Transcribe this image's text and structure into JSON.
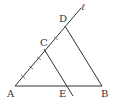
{
  "diagram": {
    "type": "geometry",
    "points": {
      "A": {
        "label": "A",
        "x": 15,
        "y": 86
      },
      "B": {
        "label": "B",
        "x": 102,
        "y": 86
      },
      "C": {
        "label": "C",
        "x": 44,
        "y": 50
      },
      "D": {
        "label": "D",
        "x": 65,
        "y": 26
      },
      "E": {
        "label": "E",
        "x": 67,
        "y": 86
      }
    },
    "line_label": "ℓ",
    "segments": [
      "AB",
      "AD (line ℓ)",
      "DB",
      "CE (extended)"
    ],
    "tick_marks": "equal segments marked along line ℓ from A through C to D",
    "colors": {
      "stroke": "#333333",
      "background": "#ffffff"
    }
  }
}
